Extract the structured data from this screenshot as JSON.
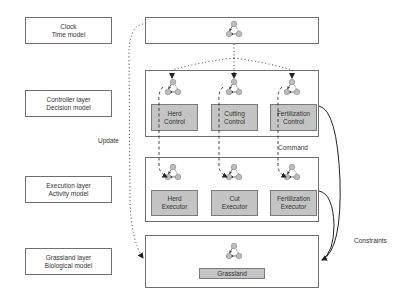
{
  "layers": [
    {
      "id": "clock",
      "label_line1": "Clock",
      "label_line2": "Time model"
    },
    {
      "id": "controller",
      "label_line1": "Controller layer",
      "label_line2": "Decision model"
    },
    {
      "id": "execution",
      "label_line1": "Execution layer",
      "label_line2": "Activity model"
    },
    {
      "id": "grassland",
      "label_line1": "Grassland layer",
      "label_line2": "Biological model"
    }
  ],
  "controller_components": [
    {
      "line1": "Herd",
      "line2": "Control"
    },
    {
      "line1": "Cutting",
      "line2": "Control"
    },
    {
      "line1": "Fertilization",
      "line2": "Control"
    }
  ],
  "execution_components": [
    {
      "line1": "Herd",
      "line2": "Executor"
    },
    {
      "line1": "Cut",
      "line2": "Executor"
    },
    {
      "line1": "Fertilization",
      "line2": "Executor"
    }
  ],
  "grassland_component": {
    "label": "Grassland"
  },
  "edge_labels": {
    "update": "Update",
    "command": "Command",
    "constraints": "Constraints"
  },
  "icons": {
    "state_machine": "three-node-cycle-icon"
  },
  "colors": {
    "component_fill": "#c4c4c4",
    "node_fill": "#bdbdbd",
    "border": "#6f6f6f"
  }
}
